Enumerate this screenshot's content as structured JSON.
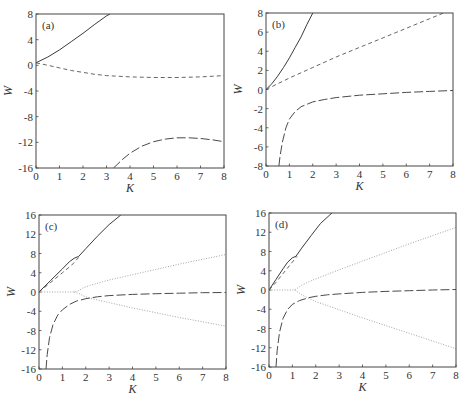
{
  "figure": {
    "panel_labels": [
      "(a)",
      "(b)",
      "(c)",
      "(d)"
    ],
    "xlabel": "K",
    "ylabel": "W"
  },
  "chart_data": [
    {
      "panel": "(a)",
      "type": "line",
      "title": "",
      "xlabel": "K",
      "ylabel": "W",
      "xlim": [
        0,
        8
      ],
      "ylim": [
        -16,
        8
      ],
      "xticks": [
        0,
        1,
        2,
        3,
        4,
        5,
        6,
        7,
        8
      ],
      "yticks": [
        -16,
        -12,
        -8,
        -4,
        0,
        4,
        8
      ],
      "grid": false,
      "frame_px": {
        "left": 36,
        "top": 14,
        "right": 224,
        "bottom": 168
      },
      "series": [
        {
          "name": "solid branch",
          "style": "solid",
          "x": [
            0,
            0.5,
            1,
            1.5,
            2,
            2.5,
            3,
            3.15
          ],
          "y": [
            0.4,
            1.3,
            2.4,
            3.7,
            5.0,
            6.4,
            7.7,
            8.0
          ]
        },
        {
          "name": "short-dash branch",
          "style": "dash",
          "x": [
            0,
            0.5,
            1,
            1.5,
            2,
            2.5,
            3,
            4,
            5,
            6,
            7,
            8
          ],
          "y": [
            0.4,
            0.0,
            -0.4,
            -0.8,
            -1.1,
            -1.4,
            -1.6,
            -1.8,
            -1.9,
            -1.9,
            -1.8,
            -1.6
          ]
        },
        {
          "name": "long-dash branch",
          "style": "longdash",
          "x": [
            3.3,
            3.7,
            4,
            4.5,
            5,
            5.5,
            6,
            6.5,
            7,
            7.5,
            8
          ],
          "y": [
            -16,
            -14.6,
            -13.7,
            -12.6,
            -11.9,
            -11.5,
            -11.3,
            -11.3,
            -11.4,
            -11.6,
            -11.9
          ]
        }
      ]
    },
    {
      "panel": "(b)",
      "type": "line",
      "title": "",
      "xlabel": "K",
      "ylabel": "W",
      "xlim": [
        0,
        8
      ],
      "ylim": [
        -8,
        8
      ],
      "xticks": [
        0,
        1,
        2,
        3,
        4,
        5,
        6,
        7,
        8
      ],
      "yticks": [
        -8,
        -6,
        -4,
        -2,
        0,
        2,
        4,
        6,
        8
      ],
      "grid": false,
      "frame_px": {
        "left": 266,
        "top": 13,
        "right": 453,
        "bottom": 166
      },
      "series": [
        {
          "name": "solid branch",
          "style": "solid",
          "x": [
            0,
            0.25,
            0.5,
            0.75,
            1,
            1.25,
            1.5,
            1.75,
            2.0
          ],
          "y": [
            0,
            0.6,
            1.4,
            2.3,
            3.3,
            4.4,
            5.5,
            6.8,
            8.0
          ]
        },
        {
          "name": "short-dash branch",
          "style": "dash",
          "x": [
            0,
            1,
            2,
            3,
            4,
            5,
            6,
            7,
            7.6
          ],
          "y": [
            0,
            1.2,
            2.3,
            3.4,
            4.4,
            5.4,
            6.4,
            7.4,
            8.0
          ]
        },
        {
          "name": "long-dash branch",
          "style": "longdash",
          "x": [
            0.55,
            0.6,
            0.7,
            0.85,
            1,
            1.25,
            1.5,
            2,
            2.5,
            3,
            4,
            5,
            6,
            7,
            8
          ],
          "y": [
            -8,
            -7.0,
            -5.5,
            -4.0,
            -3.1,
            -2.3,
            -1.8,
            -1.3,
            -1.05,
            -0.85,
            -0.6,
            -0.45,
            -0.3,
            -0.2,
            -0.1
          ]
        }
      ]
    },
    {
      "panel": "(c)",
      "type": "line",
      "title": "",
      "xlabel": "K",
      "ylabel": "W",
      "xlim": [
        0,
        8
      ],
      "ylim": [
        -16,
        16
      ],
      "xticks": [
        0,
        1,
        2,
        3,
        4,
        5,
        6,
        7,
        8
      ],
      "yticks": [
        -16,
        -12,
        -8,
        -4,
        0,
        4,
        8,
        12,
        16
      ],
      "grid": false,
      "frame_px": {
        "left": 39,
        "top": 215,
        "right": 226,
        "bottom": 369
      },
      "series": [
        {
          "name": "solid branch",
          "style": "solid",
          "x": [
            0,
            0.5,
            1,
            1.3,
            1.5,
            1.7,
            2,
            2.5,
            3,
            3.5
          ],
          "y": [
            0,
            2.4,
            4.8,
            6.3,
            7.0,
            7.4,
            9.0,
            11.6,
            14.0,
            16.0
          ]
        },
        {
          "name": "short-dash branch",
          "style": "dash",
          "x": [
            0,
            0.5,
            1,
            1.4,
            1.7
          ],
          "y": [
            0,
            2.0,
            4.0,
            5.6,
            7.2
          ]
        },
        {
          "name": "dotted upper branch",
          "style": "dot",
          "x": [
            0,
            0.5,
            1,
            1.5,
            1.7,
            1.9,
            2.2,
            3,
            4,
            5,
            6,
            7,
            8
          ],
          "y": [
            0,
            0,
            0,
            0,
            0.3,
            0.9,
            1.4,
            2.5,
            3.6,
            4.7,
            5.8,
            6.8,
            7.8
          ]
        },
        {
          "name": "dotted lower branch",
          "style": "dot",
          "x": [
            1.5,
            1.7,
            1.9,
            2.2,
            3,
            4,
            5,
            6,
            7,
            8
          ],
          "y": [
            0,
            -0.3,
            -0.8,
            -1.3,
            -2.2,
            -3.3,
            -4.3,
            -5.3,
            -6.2,
            -7.1
          ]
        },
        {
          "name": "long-dash branch",
          "style": "longdash",
          "x": [
            0.3,
            0.35,
            0.45,
            0.6,
            0.8,
            1,
            1.3,
            1.6,
            2,
            2.5,
            3,
            4,
            5,
            6,
            7,
            8
          ],
          "y": [
            -16,
            -13.0,
            -9.5,
            -6.8,
            -4.8,
            -3.7,
            -2.6,
            -1.9,
            -1.4,
            -1.0,
            -0.75,
            -0.5,
            -0.35,
            -0.25,
            -0.15,
            -0.1
          ]
        }
      ]
    },
    {
      "panel": "(d)",
      "type": "line",
      "title": "",
      "xlabel": "K",
      "ylabel": "W",
      "xlim": [
        0,
        8
      ],
      "ylim": [
        -16,
        16
      ],
      "xticks": [
        0,
        1,
        2,
        3,
        4,
        5,
        6,
        7,
        8
      ],
      "yticks": [
        -16,
        -12,
        -8,
        -4,
        0,
        4,
        8,
        12,
        16
      ],
      "grid": false,
      "frame_px": {
        "left": 269,
        "top": 213,
        "right": 456,
        "bottom": 367
      },
      "series": [
        {
          "name": "solid branch",
          "style": "solid",
          "x": [
            0,
            0.3,
            0.6,
            0.8,
            1.0,
            1.15,
            1.4,
            1.8,
            2.2,
            2.6,
            2.7
          ],
          "y": [
            0,
            2.2,
            4.4,
            5.8,
            6.7,
            7.0,
            8.7,
            11.3,
            13.8,
            15.6,
            16.0
          ]
        },
        {
          "name": "short-dash branch",
          "style": "dash",
          "x": [
            0,
            0.3,
            0.6,
            0.9,
            1.2
          ],
          "y": [
            0,
            1.6,
            3.4,
            5.2,
            7.0
          ]
        },
        {
          "name": "dotted upper branch",
          "style": "dot",
          "x": [
            0,
            0.5,
            1.1,
            1.25,
            1.4,
            1.7,
            2,
            3,
            4,
            5,
            6,
            7,
            8
          ],
          "y": [
            0,
            0,
            0,
            0.5,
            1.0,
            1.7,
            2.3,
            4.2,
            6.0,
            7.8,
            9.6,
            11.3,
            13.0
          ]
        },
        {
          "name": "dotted lower branch",
          "style": "dot",
          "x": [
            1.1,
            1.25,
            1.4,
            1.7,
            2,
            3,
            4,
            5,
            6,
            7,
            8
          ],
          "y": [
            0,
            -0.5,
            -1.0,
            -1.7,
            -2.4,
            -4.1,
            -5.8,
            -7.4,
            -9.0,
            -10.6,
            -12.2
          ]
        },
        {
          "name": "long-dash branch",
          "style": "longdash",
          "x": [
            0.3,
            0.35,
            0.45,
            0.6,
            0.8,
            1,
            1.3,
            1.7,
            2,
            2.5,
            3,
            4,
            5,
            6,
            7,
            8
          ],
          "y": [
            -16,
            -12.5,
            -8.8,
            -5.9,
            -4.0,
            -3.0,
            -2.2,
            -1.6,
            -1.3,
            -1.0,
            -0.8,
            -0.5,
            -0.3,
            -0.15,
            0.0,
            0.1
          ]
        }
      ]
    }
  ],
  "colors": {
    "solid": "#3a3a3a",
    "dash": "#555555",
    "longdash": "#4a4a4a",
    "dot": "#9a9a9a",
    "axis": "#444444"
  }
}
